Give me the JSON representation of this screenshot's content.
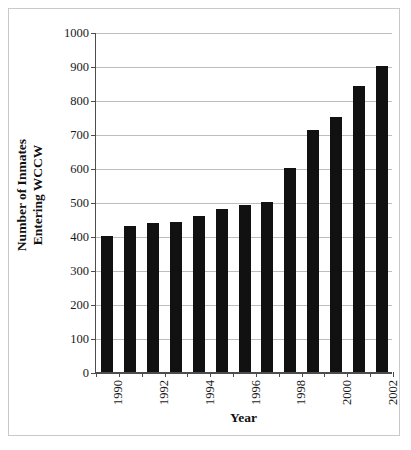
{
  "figure": {
    "background_color": "#ffffff",
    "frame_color": "#c9c9c9",
    "axis_color": "#4d4d4d",
    "grid_color": "#bdbdbd",
    "bar_color": "#111111"
  },
  "chart_data": {
    "type": "bar",
    "title": "",
    "xlabel": "Year",
    "ylabel": "Number of Inmates Entering WCCW",
    "ylabel_lines": [
      "Number of Inmates",
      "Entering WCCW"
    ],
    "categories": [
      "1990",
      "1991",
      "1992",
      "1993",
      "1994",
      "1995",
      "1996",
      "1997",
      "1998",
      "1999",
      "2000",
      "2001",
      "2002"
    ],
    "values": [
      400,
      430,
      437,
      440,
      460,
      480,
      490,
      500,
      600,
      712,
      750,
      840,
      900
    ],
    "ylim": [
      0,
      1000
    ],
    "yticks": [
      0,
      100,
      200,
      300,
      400,
      500,
      600,
      700,
      800,
      900,
      1000
    ],
    "ytick_labels": [
      "0",
      "100",
      "200",
      "300",
      "400",
      "500",
      "600",
      "700",
      "800",
      "900",
      "1000"
    ],
    "xtick_labels_shown": [
      "1990",
      "1992",
      "1994",
      "1996",
      "1998",
      "2000",
      "2002"
    ],
    "xtick_label_rotation": 90,
    "grid": "horizontal",
    "legend": "none"
  }
}
